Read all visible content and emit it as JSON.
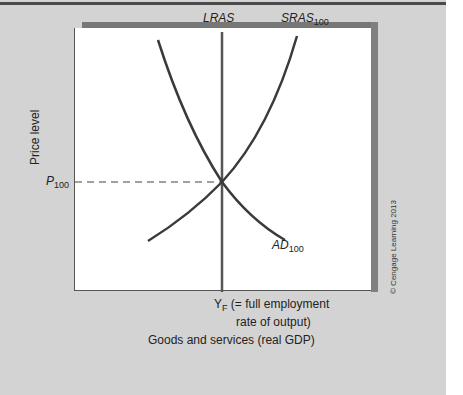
{
  "figure": {
    "type": "aggregate-supply-demand-diagram",
    "y_axis_label": "Price level",
    "x_axis_label": "Goods and services (real GDP)",
    "price_marker": {
      "main": "P",
      "sub": "100"
    },
    "output_marker": {
      "main": "Y",
      "sub": "F",
      "text_line1": " (= full employment",
      "text_line2": "rate of output)"
    },
    "curves": {
      "lras": {
        "label": "LRAS"
      },
      "sras": {
        "main": "SRAS",
        "sub": "100"
      },
      "ad": {
        "main": "AD",
        "sub": "100"
      }
    },
    "credit": "© Cengage Learning 2013"
  },
  "colors": {
    "background": "#d3d3d3",
    "plot_background": "#ffffff",
    "curve": "#3a3a3a",
    "frame_shadow": "#7a7a7a"
  }
}
